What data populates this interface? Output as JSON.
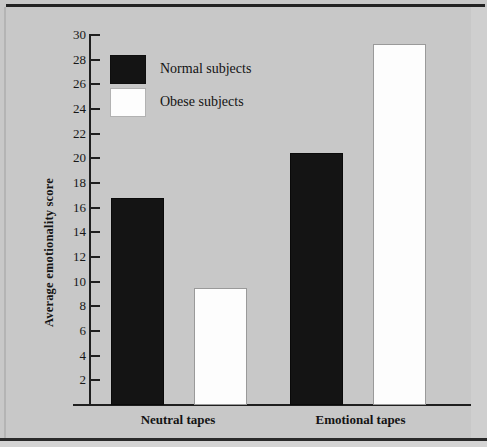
{
  "chart_data": {
    "type": "bar",
    "title": "",
    "xlabel": "",
    "ylabel": "Average emotionality score",
    "categories": [
      "Neutral tapes",
      "Emotional tapes"
    ],
    "series": [
      {
        "name": "Normal subjects",
        "color": "#141414",
        "values": [
          16.8,
          20.4
        ]
      },
      {
        "name": "Obese subjects",
        "color": "#fdfdfd",
        "values": [
          9.5,
          29.3
        ]
      }
    ],
    "ylim": [
      0,
      30
    ],
    "yticks": [
      2,
      4,
      6,
      8,
      10,
      12,
      14,
      16,
      18,
      20,
      22,
      24,
      26,
      28,
      30
    ],
    "ytick_labels": [
      "2",
      "4",
      "6",
      "8",
      "10",
      "12",
      "14",
      "16",
      "18",
      "20",
      "22",
      "24",
      "26",
      "28",
      "30"
    ],
    "grid": false,
    "legend_position": "top-left",
    "legend_entries": [
      "Normal subjects",
      "Obese subjects"
    ]
  },
  "colors": {
    "background": "#c8c8c8",
    "axis": "#1f1f1f",
    "normal_bar": "#141414",
    "obese_bar": "#fdfdfd",
    "text": "#141414"
  }
}
